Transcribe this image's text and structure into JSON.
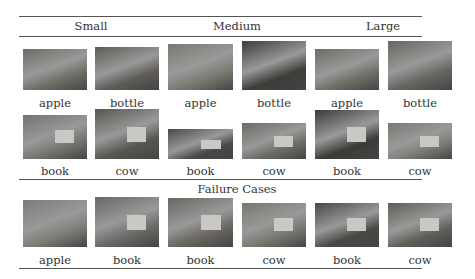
{
  "headers": [
    "Small",
    "Medium",
    "Large"
  ],
  "section_title": "Failure Cases",
  "rows": [
    {
      "cells": [
        {
          "label": "apple",
          "tone": "#6d6d66",
          "x": 23,
          "y": 49,
          "w": 64,
          "h": 41
        },
        {
          "label": "bottle",
          "tone": "#5e5b56",
          "x": 95,
          "y": 47,
          "w": 64,
          "h": 43
        },
        {
          "label": "apple",
          "tone": "#7a7a72",
          "x": 168,
          "y": 44,
          "w": 65,
          "h": 46
        },
        {
          "label": "bottle",
          "tone": "#3e3c38",
          "x": 242,
          "y": 41,
          "w": 64,
          "h": 49
        },
        {
          "label": "apple",
          "tone": "#6d6d66",
          "x": 315,
          "y": 49,
          "w": 64,
          "h": 41
        },
        {
          "label": "bottle",
          "tone": "#666660",
          "x": 388,
          "y": 41,
          "w": 64,
          "h": 49
        }
      ]
    },
    {
      "cells": [
        {
          "label": "book",
          "tone": "#737370",
          "x": 23,
          "y": 115,
          "w": 64,
          "h": 44
        },
        {
          "label": "cow",
          "tone": "#565750",
          "x": 95,
          "y": 109,
          "w": 64,
          "h": 50
        },
        {
          "label": "book",
          "tone": "#48484a",
          "x": 168,
          "y": 129,
          "w": 65,
          "h": 30
        },
        {
          "label": "cow",
          "tone": "#6a6a65",
          "x": 242,
          "y": 123,
          "w": 64,
          "h": 36
        },
        {
          "label": "book",
          "tone": "#3c3b38",
          "x": 315,
          "y": 110,
          "w": 64,
          "h": 49
        },
        {
          "label": "cow",
          "tone": "#7a7a74",
          "x": 388,
          "y": 123,
          "w": 64,
          "h": 36
        }
      ]
    },
    {
      "cells": [
        {
          "label": "apple",
          "tone": "#7c7c76",
          "x": 23,
          "y": 200,
          "w": 64,
          "h": 47
        },
        {
          "label": "book",
          "tone": "#6a6865",
          "x": 95,
          "y": 197,
          "w": 64,
          "h": 50
        },
        {
          "label": "book",
          "tone": "#6a6660",
          "x": 168,
          "y": 198,
          "w": 65,
          "h": 49
        },
        {
          "label": "cow",
          "tone": "#777770",
          "x": 242,
          "y": 203,
          "w": 64,
          "h": 44
        },
        {
          "label": "book",
          "tone": "#4a4844",
          "x": 315,
          "y": 203,
          "w": 64,
          "h": 44
        },
        {
          "label": "cow",
          "tone": "#5e5e58",
          "x": 388,
          "y": 203,
          "w": 64,
          "h": 44
        }
      ]
    }
  ],
  "label_y": [
    96,
    164,
    253
  ]
}
